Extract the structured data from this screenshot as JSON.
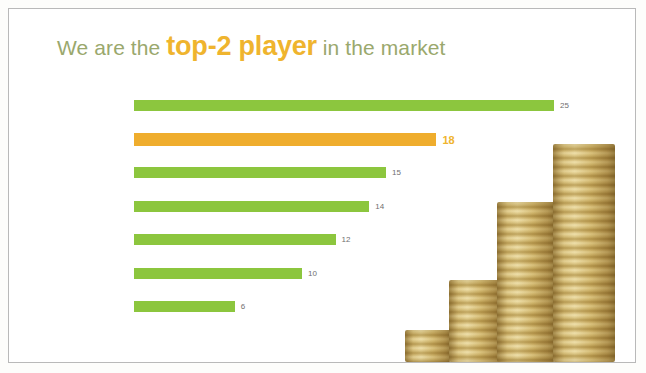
{
  "slide": {
    "title": {
      "before": "We are the ",
      "accent": "top-2 player",
      "after": " in the market"
    },
    "accent_color": "#efb42e",
    "title_color": "#9aa86d",
    "bar_color": "#8cc63e",
    "highlight_bar_color": "#efad2d",
    "label_color": "#6f6f6f",
    "border_color": "#b9b9b9",
    "decoration": "coin-stacks-photo"
  },
  "chart_data": {
    "type": "bar",
    "orientation": "horizontal",
    "title": "We are the top-2 player in the market",
    "xlabel": "",
    "ylabel": "",
    "xlim": [
      0,
      25
    ],
    "grid": false,
    "legend": "none",
    "categories": [
      "Market leader",
      "Our Company",
      "Company #4",
      "Company #1",
      "Company #6",
      "Company #3",
      "Company #2"
    ],
    "values": [
      25,
      18,
      15,
      14,
      12,
      10,
      6
    ],
    "highlight_index": 1,
    "bars": [
      {
        "label": "Market leader",
        "value": 25,
        "value_text": "25",
        "highlight": false
      },
      {
        "label": "Our Company",
        "value": 18,
        "value_text": "18",
        "highlight": true
      },
      {
        "label": "Company #4",
        "value": 15,
        "value_text": "15",
        "highlight": false
      },
      {
        "label": "Company #1",
        "value": 14,
        "value_text": "14",
        "highlight": false
      },
      {
        "label": "Company #6",
        "value": 12,
        "value_text": "12",
        "highlight": false
      },
      {
        "label": "Company #3",
        "value": 10,
        "value_text": "10",
        "highlight": false
      },
      {
        "label": "Company #2",
        "value": 6,
        "value_text": "6",
        "highlight": false
      }
    ]
  }
}
